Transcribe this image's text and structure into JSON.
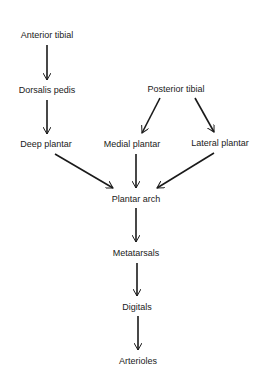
{
  "diagram": {
    "type": "flowchart",
    "nodes": [
      {
        "id": "anterior_tibial",
        "label": "Anterior tibial",
        "x": 47,
        "y": 35
      },
      {
        "id": "dorsalis_pedis",
        "label": "Dorsalis pedis",
        "x": 47,
        "y": 90
      },
      {
        "id": "deep_plantar",
        "label": "Deep plantar",
        "x": 46,
        "y": 144
      },
      {
        "id": "posterior_tibial",
        "label": "Posterior tibial",
        "x": 176,
        "y": 89
      },
      {
        "id": "medial_plantar",
        "label": "Medial plantar",
        "x": 132,
        "y": 144
      },
      {
        "id": "lateral_plantar",
        "label": "Lateral plantar",
        "x": 220,
        "y": 143
      },
      {
        "id": "plantar_arch",
        "label": "Plantar arch",
        "x": 136,
        "y": 199
      },
      {
        "id": "metatarsals",
        "label": "Metatarsals",
        "x": 136,
        "y": 253
      },
      {
        "id": "digitals",
        "label": "Digitals",
        "x": 137,
        "y": 307
      },
      {
        "id": "arterioles",
        "label": "Arterioles",
        "x": 138,
        "y": 361
      }
    ],
    "edges": [
      {
        "from": "anterior_tibial",
        "to": "dorsalis_pedis",
        "x1": 47,
        "y1": 45,
        "x2": 47,
        "y2": 80
      },
      {
        "from": "dorsalis_pedis",
        "to": "deep_plantar",
        "x1": 47,
        "y1": 100,
        "x2": 47,
        "y2": 134
      },
      {
        "from": "posterior_tibial",
        "to": "medial_plantar",
        "x1": 160,
        "y1": 98,
        "x2": 142,
        "y2": 133
      },
      {
        "from": "posterior_tibial",
        "to": "lateral_plantar",
        "x1": 195,
        "y1": 98,
        "x2": 214,
        "y2": 132
      },
      {
        "from": "deep_plantar",
        "to": "plantar_arch",
        "x1": 55,
        "y1": 154,
        "x2": 113,
        "y2": 188
      },
      {
        "from": "medial_plantar",
        "to": "plantar_arch",
        "x1": 136,
        "y1": 154,
        "x2": 136,
        "y2": 188
      },
      {
        "from": "lateral_plantar",
        "to": "plantar_arch",
        "x1": 214,
        "y1": 153,
        "x2": 157,
        "y2": 188
      },
      {
        "from": "plantar_arch",
        "to": "metatarsals",
        "x1": 136,
        "y1": 208,
        "x2": 136,
        "y2": 242
      },
      {
        "from": "metatarsals",
        "to": "digitals",
        "x1": 137,
        "y1": 263,
        "x2": 137,
        "y2": 296
      },
      {
        "from": "digitals",
        "to": "arterioles",
        "x1": 138,
        "y1": 316,
        "x2": 138,
        "y2": 350
      }
    ],
    "colors": {
      "line": "#1a1a1a",
      "text": "#1a1a1a",
      "background": "#ffffff"
    }
  }
}
